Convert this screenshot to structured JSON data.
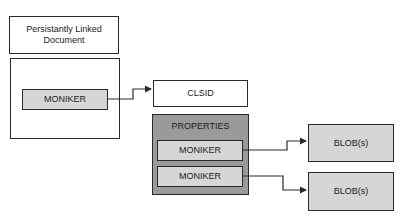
{
  "diagram": {
    "document_label": "Persistantly Linked Document",
    "moniker_left": "MONIKER",
    "clsid": "CLSID",
    "properties": {
      "label": "PROPERTIES",
      "monikers": [
        "MONIKER",
        "MONIKER"
      ]
    },
    "blobs": [
      "BLOB(s)",
      "BLOB(s)"
    ],
    "connections": [
      {
        "from": "moniker_left",
        "to": "clsid"
      },
      {
        "from": "properties.monikers.0",
        "to": "blobs.0"
      },
      {
        "from": "properties.monikers.1",
        "to": "blobs.1"
      }
    ],
    "colors": {
      "border": "#2a2a2a",
      "light_fill": "#d6d6d6",
      "dark_fill": "#9a9a9a",
      "background": "#ffffff"
    }
  }
}
